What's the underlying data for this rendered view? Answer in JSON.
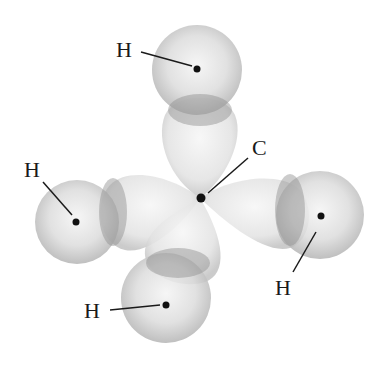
{
  "diagram": {
    "title": "",
    "molecule": "CH4 orbital overlap",
    "atoms": [
      {
        "id": "carbon",
        "label": "C"
      },
      {
        "id": "hydrogen-top",
        "label": "H"
      },
      {
        "id": "hydrogen-left",
        "label": "H"
      },
      {
        "id": "hydrogen-right",
        "label": "H"
      },
      {
        "id": "hydrogen-bottom",
        "label": "H"
      }
    ],
    "colors": {
      "orbital_light": "#f2f2f2",
      "orbital_mid": "#c8c8c8",
      "overlap": "#9a9a9a",
      "nucleus": "#111111",
      "label": "#1a1a1a"
    }
  }
}
